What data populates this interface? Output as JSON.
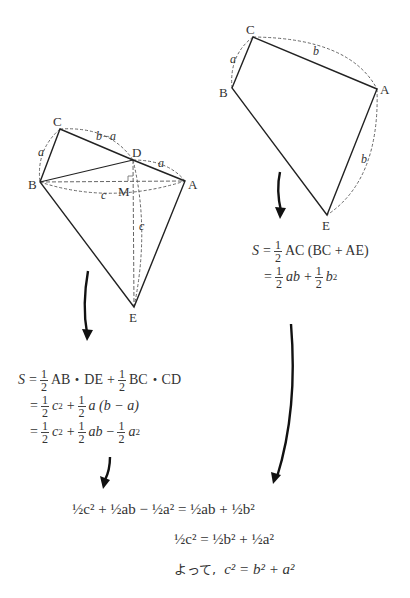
{
  "left_figure": {
    "vertices": {
      "A": "A",
      "B": "B",
      "C": "C",
      "D": "D",
      "E": "E",
      "M": "M"
    },
    "edge_labels": {
      "BC": "a",
      "CD": "b−a",
      "DA": "a",
      "BA": "c",
      "DE": "c"
    }
  },
  "right_figure": {
    "vertices": {
      "A": "A",
      "B": "B",
      "C": "C",
      "E": "E"
    },
    "edge_labels": {
      "BC": "a",
      "CA": "b",
      "AE": "b"
    }
  },
  "right_formula": {
    "line1": {
      "lhs": "S",
      "eq": "=",
      "half": "1/2",
      "text": "AC (BC + AE)"
    },
    "line2": {
      "eq": "=",
      "t1": "ab",
      "plus": "+",
      "t2": "b",
      "exp": "2"
    }
  },
  "left_formula": {
    "line1": {
      "lhs": "S",
      "eq": "=",
      "t1": "AB・DE",
      "plus": "+",
      "t2": "BC・CD"
    },
    "line2": {
      "eq": "=",
      "t1": "c",
      "exp": "2",
      "plus": "+",
      "t2": "a (b − a)"
    },
    "line3": {
      "eq": "=",
      "t1": "c",
      "exp": "2",
      "plus": "+",
      "t2": "ab",
      "minus": "−",
      "t3": "a"
    }
  },
  "conclusion": {
    "line1": "½c² + ½ab − ½a² = ½ab + ½b²",
    "line2": "½c² = ½b² + ½a²",
    "line3_prefix": "よって,",
    "line3": "c² = b² + a²"
  },
  "fraction": {
    "num": "1",
    "den": "2"
  }
}
